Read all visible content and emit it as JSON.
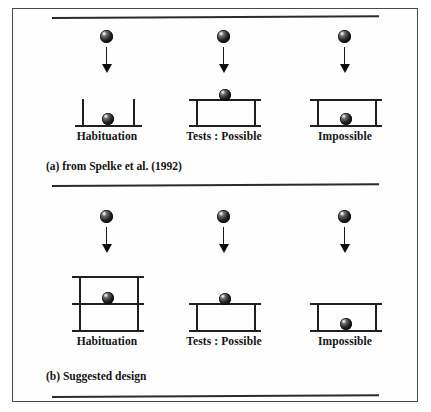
{
  "figure": {
    "panels": [
      {
        "id": "panel-a",
        "caption": "(a) from Spelke et al. (1992)",
        "cases": [
          {
            "id": "a-habituation",
            "label": "Habituation",
            "apparatus": "two-vertical-posts-with-floor",
            "ball_position": "resting-on-floor"
          },
          {
            "id": "a-possible",
            "label": "Tests : Possible",
            "apparatus": "closed-box-top-and-floor",
            "ball_position": "resting-on-top-surface"
          },
          {
            "id": "a-impossible",
            "label": "Impossible",
            "apparatus": "closed-box-top-and-floor",
            "ball_position": "inside-box-on-floor"
          }
        ]
      },
      {
        "id": "panel-b",
        "caption": "(b) Suggested design",
        "cases": [
          {
            "id": "b-habituation",
            "label": "Habituation",
            "apparatus": "tall-box-with-middle-shelf",
            "ball_position": "resting-on-middle-shelf"
          },
          {
            "id": "b-possible",
            "label": "Tests : Possible",
            "apparatus": "closed-box-top-and-floor",
            "ball_position": "resting-on-top-surface"
          },
          {
            "id": "b-impossible",
            "label": "Impossible",
            "apparatus": "closed-box-top-and-floor",
            "ball_position": "inside-box-on-floor"
          }
        ]
      }
    ],
    "motion_arrow": {
      "name": "downward-falling-arrow",
      "direction": "down"
    },
    "colors": {
      "ink": "#1f1f1f",
      "rule": "#2b2b2b",
      "frame": "#4a4a4a",
      "paper": "#ffffff"
    }
  }
}
